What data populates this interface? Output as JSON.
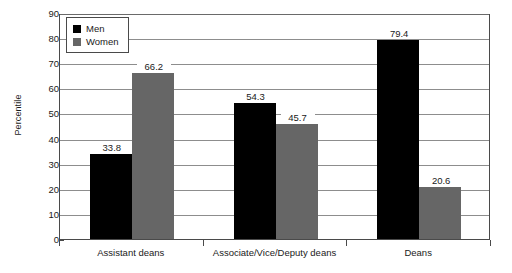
{
  "chart_data": {
    "type": "bar",
    "title": "",
    "subtitle": "",
    "xlabel": "",
    "ylabel": "Percentile",
    "ylim": [
      0,
      90
    ],
    "ytick_step": 10,
    "yticks": [
      0,
      10,
      20,
      30,
      40,
      50,
      60,
      70,
      80,
      90
    ],
    "ytick_labels": [
      "0",
      "10",
      "20",
      "30",
      "40",
      "50",
      "60",
      "70",
      "80",
      "90"
    ],
    "grid": true,
    "grid_axis": "y",
    "legend_position": "upper-left-inside",
    "categories": [
      "Assistant deans",
      "Associate/Vice/Deputy deans",
      "Deans"
    ],
    "series": [
      {
        "name": "Men",
        "color": "#000000",
        "values": [
          33.8,
          54.3,
          79.4
        ],
        "labels": [
          "33.8",
          "54.3",
          "79.4"
        ]
      },
      {
        "name": "Women",
        "color": "#666666",
        "values": [
          66.2,
          45.7,
          20.6
        ],
        "labels": [
          "66.2",
          "45.7",
          "20.6"
        ]
      }
    ]
  },
  "legend": {
    "items": [
      {
        "label": "Men",
        "swatch": "men-swatch"
      },
      {
        "label": "Women",
        "swatch": "women-swatch"
      }
    ]
  }
}
